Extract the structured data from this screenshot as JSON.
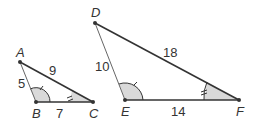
{
  "figure": {
    "triangle_small": {
      "vertices": {
        "A": "A",
        "B": "B",
        "C": "C"
      },
      "sides": {
        "AB": "5",
        "AC": "9",
        "BC": "7"
      }
    },
    "triangle_large": {
      "vertices": {
        "D": "D",
        "E": "E",
        "F": "F"
      },
      "sides": {
        "DE": "10",
        "DF": "18",
        "EF": "14"
      }
    },
    "angle_marks": {
      "B_and_E": "single arc with one tick",
      "C_and_F": "shaded angle with two ticks"
    },
    "colors": {
      "line": "#333333",
      "thin_line": "#555555",
      "shade": "#d9d9d9"
    }
  }
}
